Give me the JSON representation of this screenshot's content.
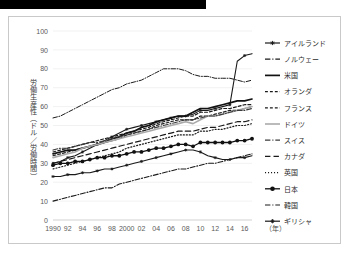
{
  "figure": {
    "redaction_bar": "",
    "x_axis_unit_label": "（年）",
    "y_axis_title": "労働生産性（ドル／労働時間）"
  },
  "chart_data": {
    "type": "line",
    "title": "",
    "xlabel": "（年）",
    "ylabel": "労働生産性（ドル／労働時間）",
    "xlim": [
      1990,
      2017
    ],
    "ylim": [
      0,
      100
    ],
    "ytick_step": 10,
    "yticks": [
      0,
      10,
      20,
      30,
      40,
      50,
      60,
      70,
      80,
      90,
      100
    ],
    "x": [
      1990,
      1991,
      1992,
      1993,
      1994,
      1995,
      1996,
      1997,
      1998,
      1999,
      2000,
      2001,
      2002,
      2003,
      2004,
      2005,
      2006,
      2007,
      2008,
      2009,
      2010,
      2011,
      2012,
      2013,
      2014,
      2015,
      2016,
      2017
    ],
    "xticks": [
      1990,
      1992,
      1994,
      1996,
      1998,
      2000,
      2002,
      2004,
      2006,
      2008,
      2010,
      2012,
      2014,
      2016
    ],
    "xticklabels": [
      "1990",
      "92",
      "94",
      "96",
      "98",
      "2000",
      "02",
      "04",
      "06",
      "08",
      "10",
      "12",
      "14",
      "16"
    ],
    "grid": "horizontal",
    "legend_position": "right",
    "series": [
      {
        "name": "アイルランド",
        "style": "solid-marker",
        "color": "#1a1a1a",
        "width": 1.1,
        "marker": "star",
        "values": [
          30,
          31,
          33,
          34,
          36,
          38,
          40,
          42,
          44,
          46,
          48,
          49,
          50,
          51,
          52,
          53,
          54,
          55,
          55,
          56,
          58,
          58,
          59,
          60,
          61,
          84,
          87,
          88
        ]
      },
      {
        "name": "ノルウェー",
        "style": "dash-dot",
        "color": "#1a1a1a",
        "width": 1.0,
        "marker": "none",
        "values": [
          54,
          55,
          57,
          59,
          61,
          63,
          65,
          67,
          69,
          70,
          72,
          73,
          74,
          76,
          78,
          80,
          80,
          80,
          79,
          77,
          76,
          76,
          75,
          75,
          75,
          74,
          73,
          74
        ]
      },
      {
        "name": "米国",
        "style": "solid",
        "color": "#111111",
        "width": 1.7,
        "marker": "none",
        "values": [
          35,
          36,
          37,
          37,
          38,
          39,
          40,
          41,
          43,
          44,
          46,
          47,
          49,
          50,
          52,
          53,
          54,
          55,
          55,
          57,
          59,
          59,
          60,
          61,
          62,
          63,
          63,
          64
        ]
      },
      {
        "name": "オランダ",
        "style": "dashed",
        "color": "#1a1a1a",
        "width": 1.2,
        "marker": "none",
        "values": [
          36,
          37,
          38,
          39,
          40,
          41,
          42,
          43,
          44,
          45,
          46,
          47,
          48,
          49,
          51,
          52,
          53,
          54,
          55,
          55,
          57,
          57,
          58,
          59,
          59,
          60,
          61,
          61
        ]
      },
      {
        "name": "フランス",
        "style": "dashed",
        "color": "#1a1a1a",
        "width": 1.2,
        "marker": "none",
        "values": [
          34,
          35,
          36,
          37,
          38,
          39,
          40,
          41,
          42,
          43,
          45,
          46,
          47,
          48,
          50,
          51,
          52,
          53,
          53,
          53,
          55,
          55,
          56,
          57,
          58,
          58,
          59,
          60
        ]
      },
      {
        "name": "ドイツ",
        "style": "solid",
        "color": "#aaaaaa",
        "width": 1.6,
        "marker": "none",
        "values": [
          33,
          34,
          35,
          36,
          38,
          39,
          40,
          41,
          42,
          43,
          44,
          45,
          46,
          47,
          48,
          49,
          50,
          51,
          52,
          51,
          53,
          55,
          55,
          56,
          57,
          58,
          59,
          60
        ]
      },
      {
        "name": "スイス",
        "style": "dash-dot",
        "color": "#3a3a3a",
        "width": 1.1,
        "marker": "none",
        "values": [
          37,
          38,
          38,
          39,
          40,
          41,
          41,
          42,
          43,
          44,
          45,
          46,
          47,
          48,
          49,
          50,
          51,
          52,
          53,
          53,
          54,
          55,
          55,
          56,
          57,
          58,
          58,
          59
        ]
      },
      {
        "name": "カナダ",
        "style": "long-dash",
        "color": "#1a1a1a",
        "width": 1.2,
        "marker": "none",
        "values": [
          30,
          31,
          32,
          33,
          34,
          35,
          36,
          37,
          38,
          39,
          40,
          41,
          42,
          43,
          44,
          45,
          46,
          47,
          47,
          47,
          48,
          49,
          49,
          50,
          51,
          52,
          52,
          53
        ]
      },
      {
        "name": "英国",
        "style": "dotted",
        "color": "#1a1a1a",
        "width": 1.2,
        "marker": "none",
        "values": [
          27,
          28,
          29,
          30,
          31,
          32,
          33,
          34,
          35,
          36,
          38,
          39,
          40,
          41,
          42,
          43,
          44,
          45,
          45,
          45,
          47,
          47,
          48,
          48,
          49,
          50,
          50,
          51
        ]
      },
      {
        "name": "日本",
        "style": "solid-marker",
        "color": "#111111",
        "width": 1.3,
        "marker": "circle",
        "values": [
          29,
          30,
          30,
          31,
          31,
          32,
          33,
          33,
          34,
          34,
          35,
          36,
          36,
          37,
          38,
          38,
          39,
          40,
          40,
          39,
          41,
          41,
          41,
          41,
          41,
          42,
          42,
          43
        ]
      },
      {
        "name": "韓国",
        "style": "dash-dot",
        "color": "#1a1a1a",
        "width": 1.1,
        "marker": "none",
        "values": [
          10,
          11,
          12,
          13,
          14,
          15,
          16,
          17,
          17,
          19,
          20,
          21,
          22,
          23,
          24,
          25,
          26,
          27,
          27,
          28,
          29,
          30,
          30,
          31,
          32,
          33,
          34,
          35
        ]
      },
      {
        "name": "ギリシャ",
        "style": "solid-marker",
        "color": "#1a1a1a",
        "width": 1.1,
        "marker": "plus",
        "values": [
          23,
          23,
          24,
          24,
          25,
          25,
          26,
          27,
          27,
          28,
          29,
          30,
          31,
          32,
          33,
          34,
          35,
          36,
          37,
          37,
          36,
          34,
          33,
          32,
          32,
          33,
          33,
          34
        ]
      }
    ]
  },
  "legend": {
    "items": [
      {
        "label": "アイルランド"
      },
      {
        "label": "ノルウェー"
      },
      {
        "label": "米国"
      },
      {
        "label": "オランダ"
      },
      {
        "label": "フランス"
      },
      {
        "label": "ドイツ"
      },
      {
        "label": "スイス"
      },
      {
        "label": "カナダ"
      },
      {
        "label": "英国"
      },
      {
        "label": "日本"
      },
      {
        "label": "韓国"
      },
      {
        "label": "ギリシャ"
      }
    ]
  }
}
